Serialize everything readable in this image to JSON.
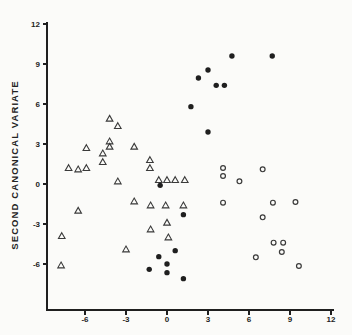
{
  "colors": {
    "ink": "#1f1f1f",
    "marker_stroke": "#3a3a3a",
    "background": "#fbfbf9"
  },
  "chart_data": {
    "type": "scatter",
    "title": "",
    "xlabel": "",
    "ylabel": "SECOND CANONICAL VARIATE",
    "xlim": [
      -8.9,
      12.2
    ],
    "ylim": [
      -9.5,
      12.1
    ],
    "x_ticks": [
      "-6",
      "-3",
      "0",
      "3",
      "6",
      "9",
      "12"
    ],
    "x_tick_values": [
      -6,
      -3,
      0,
      3,
      6,
      9,
      12
    ],
    "y_ticks": [
      "12",
      "9",
      "6",
      "3",
      "0",
      "-3",
      "-6"
    ],
    "y_tick_values": [
      12,
      9,
      6,
      3,
      0,
      -3,
      -6
    ],
    "grid": false,
    "legend": "none",
    "series": [
      {
        "name": "group-open-triangle",
        "marker": "open-triangle",
        "points": [
          [
            -4.2,
            4.9
          ],
          [
            -3.6,
            4.35
          ],
          [
            -4.2,
            3.2
          ],
          [
            -4.2,
            2.8
          ],
          [
            -5.9,
            2.7
          ],
          [
            -2.4,
            2.8
          ],
          [
            -4.7,
            2.3
          ],
          [
            -4.7,
            1.65
          ],
          [
            -7.2,
            1.2
          ],
          [
            -6.5,
            1.1
          ],
          [
            -5.9,
            1.2
          ],
          [
            -1.25,
            1.8
          ],
          [
            -1.25,
            1.2
          ],
          [
            -3.6,
            0.2
          ],
          [
            -0.6,
            0.3
          ],
          [
            0.0,
            0.3
          ],
          [
            0.6,
            0.3
          ],
          [
            1.3,
            0.3
          ],
          [
            -2.4,
            -1.3
          ],
          [
            -1.2,
            -1.6
          ],
          [
            -0.1,
            -1.6
          ],
          [
            1.2,
            -1.6
          ],
          [
            -6.5,
            -2.0
          ],
          [
            0.0,
            -2.9
          ],
          [
            -1.2,
            -3.4
          ],
          [
            -7.7,
            -3.9
          ],
          [
            0.1,
            -4.0
          ],
          [
            -3.0,
            -4.9
          ],
          [
            -7.75,
            -6.1
          ]
        ]
      },
      {
        "name": "group-filled-circle",
        "marker": "filled-circle",
        "points": [
          [
            4.75,
            9.6
          ],
          [
            7.7,
            9.6
          ],
          [
            3.0,
            8.55
          ],
          [
            2.3,
            7.95
          ],
          [
            3.6,
            7.4
          ],
          [
            4.2,
            7.4
          ],
          [
            1.75,
            5.8
          ],
          [
            3.0,
            3.9
          ],
          [
            -0.5,
            -0.1
          ],
          [
            1.2,
            -2.3
          ],
          [
            0.6,
            -5.0
          ],
          [
            -0.6,
            -5.45
          ],
          [
            0.0,
            -6.0
          ],
          [
            -1.3,
            -6.4
          ],
          [
            0.0,
            -6.65
          ],
          [
            1.2,
            -7.1
          ]
        ]
      },
      {
        "name": "group-open-circle",
        "marker": "open-circle",
        "points": [
          [
            4.1,
            1.2
          ],
          [
            4.1,
            0.6
          ],
          [
            5.3,
            0.2
          ],
          [
            7.0,
            1.1
          ],
          [
            4.1,
            -1.4
          ],
          [
            7.75,
            -1.4
          ],
          [
            9.4,
            -1.35
          ],
          [
            7.0,
            -2.5
          ],
          [
            7.8,
            -4.4
          ],
          [
            8.5,
            -4.4
          ],
          [
            8.4,
            -5.1
          ],
          [
            6.5,
            -5.5
          ],
          [
            9.65,
            -6.15
          ]
        ]
      }
    ]
  }
}
